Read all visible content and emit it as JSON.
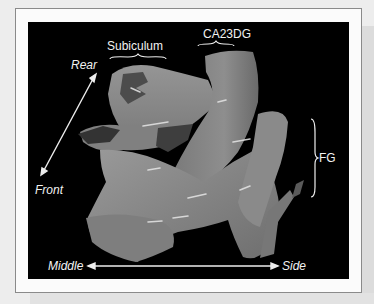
{
  "figure": {
    "labels": {
      "subiculum": "Subiculum",
      "ca23dg": "CA23DG",
      "fg": "FG",
      "rear": "Rear",
      "front": "Front",
      "middle": "Middle",
      "side": "Side"
    },
    "colors": {
      "background": "#000000",
      "surface": "#8c8c8c",
      "surface_dark": "#4a4a4a",
      "label": "#f2f2f2",
      "frame_border": "#8a8a8a",
      "page": "#ededed"
    }
  }
}
